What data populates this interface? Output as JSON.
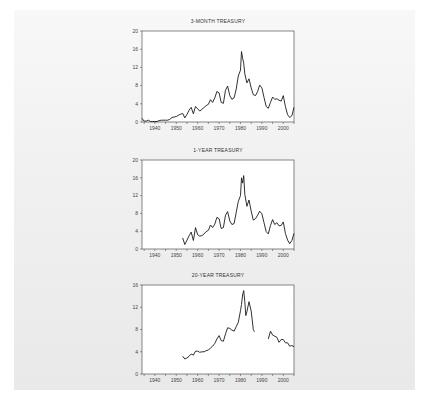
{
  "page": {
    "background": "#ffffff",
    "panel_color": "#ececec",
    "line_color": "#1a1a1a"
  },
  "chart_data": [
    {
      "type": "line",
      "title": "3-MONTH TREASURY",
      "xlabel": "",
      "ylabel": "",
      "xlim": [
        1934,
        2005
      ],
      "ylim": [
        0,
        20
      ],
      "yticks": [
        0,
        4,
        8,
        12,
        16,
        20
      ],
      "xticks": [
        1940,
        1950,
        1960,
        1970,
        1980,
        1990,
        2000
      ],
      "grid": false,
      "legend": "none",
      "x": [
        1934,
        1935,
        1936,
        1937,
        1938,
        1939,
        1940,
        1941,
        1942,
        1943,
        1944,
        1945,
        1946,
        1947,
        1948,
        1949,
        1950,
        1951,
        1952,
        1953,
        1954,
        1955,
        1956,
        1957,
        1958,
        1959,
        1960,
        1961,
        1962,
        1963,
        1964,
        1965,
        1966,
        1967,
        1968,
        1969,
        1970,
        1971,
        1972,
        1973,
        1974,
        1975,
        1976,
        1977,
        1978,
        1979,
        1980,
        1980.5,
        1981,
        1981.5,
        1982,
        1983,
        1984,
        1985,
        1986,
        1987,
        1988,
        1989,
        1990,
        1991,
        1992,
        1993,
        1994,
        1995,
        1996,
        1997,
        1998,
        1999,
        2000,
        2001,
        2002,
        2003,
        2004,
        2005
      ],
      "values": [
        0.8,
        0.2,
        0.2,
        0.4,
        0.1,
        0.1,
        0.1,
        0.1,
        0.3,
        0.4,
        0.4,
        0.4,
        0.4,
        0.6,
        1.0,
        1.1,
        1.2,
        1.5,
        1.7,
        1.9,
        0.9,
        1.7,
        2.6,
        3.2,
        1.8,
        3.4,
        2.9,
        2.4,
        2.8,
        3.2,
        3.6,
        3.9,
        4.9,
        4.3,
        5.3,
        6.7,
        6.4,
        4.3,
        4.1,
        7.0,
        7.9,
        5.8,
        5.0,
        5.3,
        7.2,
        10.1,
        11.4,
        15.5,
        14.0,
        13.0,
        10.6,
        8.6,
        9.5,
        7.5,
        6.0,
        5.8,
        6.7,
        8.1,
        7.5,
        5.4,
        3.4,
        3.0,
        4.3,
        5.5,
        5.0,
        5.1,
        4.8,
        4.6,
        5.8,
        3.4,
        1.6,
        1.0,
        1.4,
        3.2
      ]
    },
    {
      "type": "line",
      "title": "1-YEAR TREASURY",
      "xlabel": "",
      "ylabel": "",
      "xlim": [
        1934,
        2005
      ],
      "ylim": [
        0,
        20
      ],
      "yticks": [
        0,
        4,
        8,
        12,
        16,
        20
      ],
      "xticks": [
        1940,
        1950,
        1960,
        1970,
        1980,
        1990,
        2000
      ],
      "grid": false,
      "legend": "none",
      "x": [
        1953,
        1954,
        1955,
        1956,
        1957,
        1958,
        1959,
        1960,
        1961,
        1962,
        1963,
        1964,
        1965,
        1966,
        1967,
        1968,
        1969,
        1970,
        1971,
        1972,
        1973,
        1974,
        1975,
        1976,
        1977,
        1978,
        1979,
        1980,
        1980.5,
        1981,
        1981.5,
        1982,
        1983,
        1984,
        1985,
        1986,
        1987,
        1988,
        1989,
        1990,
        1991,
        1992,
        1993,
        1994,
        1995,
        1996,
        1997,
        1998,
        1999,
        2000,
        2001,
        2002,
        2003,
        2004,
        2005
      ],
      "values": [
        2.5,
        1.0,
        2.0,
        3.0,
        3.8,
        1.9,
        4.8,
        3.2,
        2.9,
        3.0,
        3.4,
        3.9,
        4.2,
        5.4,
        4.8,
        5.6,
        7.1,
        6.8,
        4.6,
        4.8,
        7.6,
        8.4,
        6.3,
        5.5,
        5.7,
        8.2,
        10.7,
        12.0,
        16.0,
        14.8,
        16.5,
        12.3,
        9.6,
        11.0,
        8.5,
        6.5,
        6.8,
        7.6,
        8.5,
        7.9,
        5.9,
        3.9,
        3.4,
        5.3,
        6.6,
        5.5,
        5.9,
        5.2,
        5.3,
        6.1,
        3.5,
        2.0,
        1.2,
        1.9,
        3.5
      ]
    },
    {
      "type": "line",
      "title": "20-YEAR TREASURY",
      "xlabel": "",
      "ylabel": "",
      "xlim": [
        1934,
        2005
      ],
      "ylim": [
        0,
        16
      ],
      "yticks": [
        0,
        4,
        8,
        12,
        16
      ],
      "xticks": [
        1940,
        1950,
        1960,
        1970,
        1980,
        1990,
        2000
      ],
      "grid": false,
      "legend": "none",
      "x": [
        1953,
        1954,
        1955,
        1956,
        1957,
        1958,
        1959,
        1960,
        1961,
        1962,
        1963,
        1964,
        1965,
        1966,
        1967,
        1968,
        1969,
        1970,
        1971,
        1972,
        1973,
        1974,
        1975,
        1976,
        1977,
        1978,
        1979,
        1980,
        1980.5,
        1981,
        1981.5,
        1982,
        1982.5,
        1983,
        1984,
        1985,
        1986,
        1986.5,
        null,
        1993,
        1994,
        1995,
        1996,
        1997,
        1998,
        1999,
        2000,
        2001,
        2002,
        2003,
        2004,
        2005
      ],
      "values": [
        3.2,
        2.7,
        2.9,
        3.2,
        3.6,
        3.4,
        4.1,
        4.1,
        3.9,
        4.0,
        4.0,
        4.2,
        4.3,
        4.7,
        5.0,
        5.5,
        6.3,
        6.9,
        6.0,
        5.9,
        7.2,
        8.3,
        8.2,
        7.9,
        7.7,
        8.5,
        9.3,
        11.4,
        12.5,
        14.2,
        15.0,
        13.0,
        10.5,
        11.2,
        13.0,
        11.3,
        8.0,
        7.6,
        null,
        6.3,
        7.7,
        7.0,
        6.8,
        6.6,
        5.7,
        6.2,
        6.2,
        5.6,
        5.6,
        5.0,
        5.1,
        4.9
      ]
    }
  ]
}
